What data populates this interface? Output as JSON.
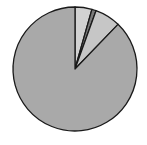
{
  "chart_data": {
    "type": "pie",
    "title": "",
    "start_angle_deg": 0,
    "direction": "clockwise",
    "legend": "none",
    "labels": [
      "",
      "",
      "",
      ""
    ],
    "slices": [
      {
        "name": "slice-1",
        "value": 4.4,
        "color": "#d2d2d2"
      },
      {
        "name": "slice-2",
        "value": 1.1,
        "color": "#7a7a7a"
      },
      {
        "name": "slice-3",
        "value": 6.7,
        "color": "#c6c6c6"
      },
      {
        "name": "slice-4",
        "value": 87.8,
        "color": "#a9a9a9"
      }
    ],
    "center": [
      75,
      69
    ],
    "radius": 62,
    "stroke": "#1a1a1a"
  }
}
